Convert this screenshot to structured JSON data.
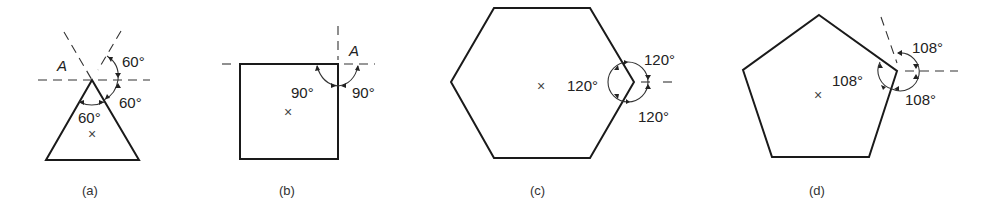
{
  "figures": [
    {
      "id": "a",
      "shape": "equilateral triangle",
      "caption": "(a)",
      "point_label": "A",
      "angle_labels": [
        "60°",
        "60°",
        "60°"
      ],
      "center_mark": "×"
    },
    {
      "id": "b",
      "shape": "square",
      "caption": "(b)",
      "point_label": "A",
      "angle_labels": [
        "90°",
        "90°"
      ],
      "center_mark": "×"
    },
    {
      "id": "c",
      "shape": "regular hexagon",
      "caption": "(c)",
      "angle_labels": [
        "120°",
        "120°",
        "120°"
      ],
      "center_mark": "×"
    },
    {
      "id": "d",
      "shape": "regular pentagon",
      "caption": "(d)",
      "angle_labels": [
        "108°",
        "108°",
        "108°"
      ],
      "center_mark": "×"
    }
  ]
}
